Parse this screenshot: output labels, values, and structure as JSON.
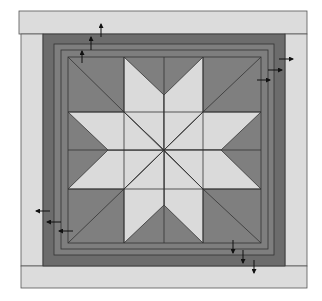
{
  "diagram": {
    "colors": {
      "background": "#ffffff",
      "outer_border": "#dcdcdc",
      "outer_frame_dark": "#6e6e6e",
      "middle_frame": "#7d7d7d",
      "block_dark": "#7f7f7f",
      "star_light": "#dadada",
      "seam_line": "#3a3a3a",
      "arrow": "#111111"
    },
    "borders": {
      "top": {
        "x": 19,
        "y": 11,
        "w": 288,
        "h": 23
      },
      "bottom": {
        "x": 21,
        "y": 266,
        "w": 286,
        "h": 22
      },
      "left": {
        "x": 21,
        "y": 34,
        "w": 22,
        "h": 232
      },
      "right": {
        "x": 285,
        "y": 34,
        "w": 22,
        "h": 232
      }
    },
    "frames": [
      {
        "name": "outer-dark-frame",
        "x": 43,
        "y": 34,
        "w": 242,
        "h": 232
      },
      {
        "name": "middle-frame",
        "x": 54,
        "y": 44,
        "w": 220,
        "h": 211
      },
      {
        "name": "inner-frame",
        "x": 61,
        "y": 50,
        "w": 207,
        "h": 199
      }
    ],
    "block": {
      "x": 68,
      "y": 57,
      "w": 193,
      "h": 186,
      "center": [
        164,
        150
      ]
    },
    "star_points": 8,
    "pressing_arrows": {
      "up": [
        [
          82,
          63,
          82,
          51
        ],
        [
          91,
          50,
          91,
          37
        ],
        [
          101,
          37,
          101,
          24
        ]
      ],
      "right": [
        [
          257,
          80,
          270,
          80
        ],
        [
          268,
          70,
          282,
          70
        ],
        [
          279,
          59,
          293,
          59
        ]
      ],
      "left": [
        [
          50,
          211,
          36,
          211
        ],
        [
          61,
          222,
          47,
          222
        ],
        [
          73,
          231,
          59,
          231
        ]
      ],
      "down": [
        [
          233,
          240,
          233,
          253
        ],
        [
          243,
          250,
          243,
          263
        ],
        [
          254,
          260,
          254,
          273
        ]
      ]
    }
  }
}
